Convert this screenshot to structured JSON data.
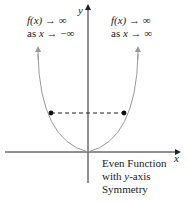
{
  "diagram": {
    "axes": {
      "x_label": "x",
      "y_label": "y"
    },
    "left_annotation": {
      "line1_fx": "f(x)",
      "line1_rest": " → ∞",
      "line2_as": "as ",
      "line2_x": "x",
      "line2_rest": " → −∞"
    },
    "right_annotation": {
      "line1_fx": "f(x)",
      "line1_rest": " → ∞",
      "line2_as": "as ",
      "line2_x": "x",
      "line2_rest": " → ∞"
    },
    "caption": {
      "line1": "Even Function",
      "line2_pre": "with ",
      "line2_y": "y",
      "line2_post": "-axis",
      "line3": "Symmetry"
    },
    "colors": {
      "axis": "#222222",
      "curve": "#9a9a9a",
      "dash": "#222222",
      "point": "#111111"
    }
  }
}
